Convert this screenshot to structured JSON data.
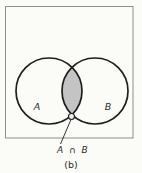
{
  "diagram": {
    "type": "venn-diagram",
    "figure_description": "Two overlapping circles inside a rectangle with shaded intersection",
    "set_a_label": "A",
    "set_b_label": "B",
    "intersection_label": "A ∩ B",
    "caption": "(b)",
    "colors": {
      "background": "#fbfbf8",
      "intersection_fill": "#c4c4c4",
      "circle_stroke": "#1e1e1e",
      "frame_stroke": "#8e8e8e",
      "text": "#2b2b2b"
    }
  }
}
